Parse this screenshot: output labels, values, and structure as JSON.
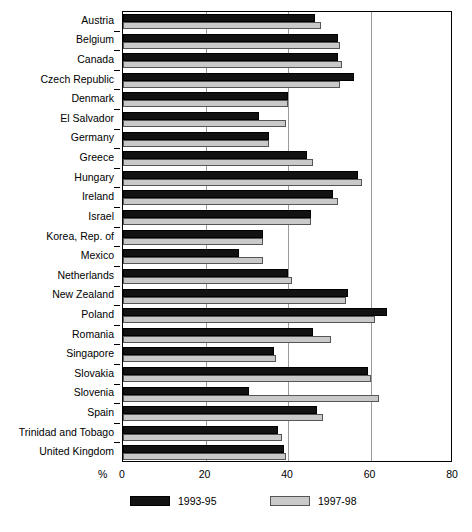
{
  "chart_data": {
    "type": "bar",
    "orientation": "horizontal",
    "title": "",
    "subtitle": "",
    "xlabel": "%",
    "ylabel": "",
    "xlim": [
      0,
      80
    ],
    "xticks": [
      0,
      20,
      40,
      60,
      80
    ],
    "xtick_labels": [
      "0",
      "20",
      "40",
      "60",
      "80"
    ],
    "grid": true,
    "grid_axis": "x",
    "legend_position": "bottom",
    "categories": [
      "Austria",
      "Belgium",
      "Canada",
      "Czech Republic",
      "Denmark",
      "El Salvador",
      "Germany",
      "Greece",
      "Hungary",
      "Ireland",
      "Israel",
      "Korea, Rep. of",
      "Mexico",
      "Netherlands",
      "New Zealand",
      "Poland",
      "Romania",
      "Singapore",
      "Slovakia",
      "Slovenia",
      "Spain",
      "Trinidad and Tobago",
      "United Kingdom"
    ],
    "series": [
      {
        "name": "1993-95",
        "color": "#121212",
        "values": [
          46.5,
          52,
          52,
          56,
          40,
          33,
          35.5,
          44.5,
          57,
          51,
          45.5,
          34,
          28,
          40,
          54.5,
          64,
          46,
          36.5,
          59.5,
          30.5,
          47,
          37.5,
          39
        ]
      },
      {
        "name": "1997-98",
        "color": "#c9c9c9",
        "values": [
          48,
          52.5,
          53,
          52.5,
          40,
          39.5,
          35.5,
          46,
          58,
          52,
          45.5,
          34,
          34,
          41,
          54,
          61,
          50.5,
          37,
          60,
          62,
          48.5,
          38.5,
          39.5
        ]
      }
    ]
  },
  "legend": {
    "items": [
      {
        "label": "1993-95"
      },
      {
        "label": "1997-98"
      }
    ]
  },
  "axis": {
    "percent_symbol": "%"
  }
}
